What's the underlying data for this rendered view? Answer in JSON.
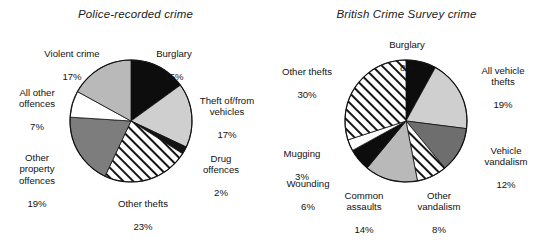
{
  "figure": {
    "background": "#ffffff",
    "text_color": "#121212"
  },
  "chart_data": [
    {
      "type": "pie",
      "title": "Police-recorded crime",
      "xlabel": "",
      "ylabel": "",
      "legend_position": "none",
      "grid": false,
      "start_angle_deg": 0,
      "direction": "clockwise",
      "categories": [
        "Burglary",
        "Theft of/from vehicles",
        "Drug offences",
        "Other thefts",
        "Other property offences",
        "All other offences",
        "Violent crime"
      ],
      "values": [
        15,
        17,
        2,
        23,
        19,
        7,
        17
      ],
      "value_labels": [
        "15%",
        "17%",
        "2%",
        "23%",
        "19%",
        "7%",
        "17%"
      ],
      "slices": [
        {
          "label": "Burglary",
          "value": 15,
          "value_label": "15%",
          "fill": "#0d0d0d",
          "pattern": "solid"
        },
        {
          "label": "Theft of/from\nvehicles",
          "value": 17,
          "value_label": "17%",
          "fill": "#cfcfcf",
          "pattern": "solid"
        },
        {
          "label": "Drug\noffences",
          "value": 2,
          "value_label": "2%",
          "fill": "#141414",
          "pattern": "solid"
        },
        {
          "label": "Other thefts",
          "value": 23,
          "value_label": "23%",
          "fill": "#ffffff",
          "pattern": "diagonal-stripes"
        },
        {
          "label": "Other\nproperty\noffences",
          "value": 19,
          "value_label": "19%",
          "fill": "#7d7d7d",
          "pattern": "solid"
        },
        {
          "label": "All other\noffences",
          "value": 7,
          "value_label": "7%",
          "fill": "#ffffff",
          "pattern": "solid"
        },
        {
          "label": "Violent crime",
          "value": 17,
          "value_label": "17%",
          "fill": "#b9b9b9",
          "pattern": "solid"
        }
      ]
    },
    {
      "type": "pie",
      "title": "British Crime Survey crime",
      "xlabel": "",
      "ylabel": "",
      "legend_position": "none",
      "grid": false,
      "start_angle_deg": 0,
      "direction": "clockwise",
      "categories": [
        "Burglary",
        "All vehicle thefts",
        "Vehicle vandalism",
        "Other vandalism",
        "Common assaults",
        "Wounding",
        "Mugging",
        "Other thefts"
      ],
      "values": [
        8,
        19,
        12,
        8,
        14,
        6,
        3,
        30
      ],
      "value_labels": [
        "8%",
        "19%",
        "12%",
        "8%",
        "14%",
        "6%",
        "3%",
        "30%"
      ],
      "slices": [
        {
          "label": "Burglary",
          "value": 8,
          "value_label": "8%",
          "fill": "#0d0d0d",
          "pattern": "solid"
        },
        {
          "label": "All vehicle\nthefts",
          "value": 19,
          "value_label": "19%",
          "fill": "#cfcfcf",
          "pattern": "solid"
        },
        {
          "label": "Vehicle\nvandalism",
          "value": 12,
          "value_label": "12%",
          "fill": "#6e6e6e",
          "pattern": "solid"
        },
        {
          "label": "Other\nvandalism",
          "value": 8,
          "value_label": "8%",
          "fill": "#ffffff",
          "pattern": "diagonal-stripes"
        },
        {
          "label": "Common\nassaults",
          "value": 14,
          "value_label": "14%",
          "fill": "#b9b9b9",
          "pattern": "solid"
        },
        {
          "label": "Wounding",
          "value": 6,
          "value_label": "6%",
          "fill": "#0d0d0d",
          "pattern": "solid"
        },
        {
          "label": "Mugging",
          "value": 3,
          "value_label": "3%",
          "fill": "#ffffff",
          "pattern": "solid"
        },
        {
          "label": "Other thefts",
          "value": 30,
          "value_label": "30%",
          "fill": "#ffffff",
          "pattern": "diagonal-stripes"
        }
      ]
    }
  ],
  "left_chart": {
    "title": "Police-recorded crime",
    "labels": {
      "violent_crime": {
        "name": "Violent crime",
        "pct": "17%"
      },
      "burglary": {
        "name": "Burglary",
        "pct": "15%"
      },
      "all_other": {
        "name": "All other\noffences",
        "pct": "7%"
      },
      "theft_vehicles": {
        "name": "Theft of/from\nvehicles",
        "pct": "17%"
      },
      "other_property": {
        "name": "Other\nproperty\noffences",
        "pct": "19%"
      },
      "drug_offences": {
        "name": "Drug\noffences",
        "pct": "2%"
      },
      "other_thefts": {
        "name": "Other thefts",
        "pct": "23%"
      }
    }
  },
  "right_chart": {
    "title": "British Crime Survey crime",
    "labels": {
      "burglary": {
        "name": "Burglary",
        "pct": "8%"
      },
      "other_thefts": {
        "name": "Other thefts",
        "pct": "30%"
      },
      "all_vehicle": {
        "name": "All vehicle\nthefts",
        "pct": "19%"
      },
      "vehicle_vandalism": {
        "name": "Vehicle\nvandalism",
        "pct": "12%"
      },
      "mugging": {
        "name": "Mugging",
        "pct": "3%"
      },
      "wounding": {
        "name": "Wounding",
        "pct": "6%"
      },
      "common_assaults": {
        "name": "Common\nassaults",
        "pct": "14%"
      },
      "other_vandalism": {
        "name": "Other\nvandalism",
        "pct": "8%"
      }
    }
  }
}
